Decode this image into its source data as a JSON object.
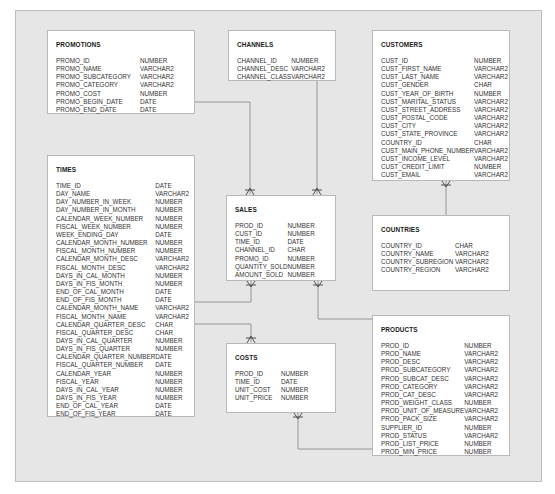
{
  "diagram": {
    "type": "entity-relationship",
    "tables": {
      "promotions": {
        "name": "PROMOTIONS",
        "columns": [
          {
            "name": "PROMO_ID",
            "type": "NUMBER"
          },
          {
            "name": "PROMO_NAME",
            "type": "VARCHAR2"
          },
          {
            "name": "PROMO_SUBCATEGORY",
            "type": "VARCHAR2"
          },
          {
            "name": "PROMO_CATEGORY",
            "type": "VARCHAR2"
          },
          {
            "name": "PROMO_COST",
            "type": "NUMBER"
          },
          {
            "name": "PROMO_BEGIN_DATE",
            "type": "DATE"
          },
          {
            "name": "PROMO_END_DATE",
            "type": "DATE"
          }
        ]
      },
      "channels": {
        "name": "CHANNELS",
        "columns": [
          {
            "name": "CHANNEL_ID",
            "type": "NUMBER"
          },
          {
            "name": "CHANNEL_DESC",
            "type": "VARCHAR2"
          },
          {
            "name": "CHANNEL_CLASS",
            "type": "VARCHAR2"
          }
        ]
      },
      "customers": {
        "name": "CUSTOMERS",
        "columns": [
          {
            "name": "CUST_ID",
            "type": "NUMBER"
          },
          {
            "name": "CUST_FIRST_NAME",
            "type": "VARCHAR2"
          },
          {
            "name": "CUST_LAST_NAME",
            "type": "VARCHAR2"
          },
          {
            "name": "CUST_GENDER",
            "type": "CHAR"
          },
          {
            "name": "CUST_YEAR_OF_BIRTH",
            "type": "NUMBER"
          },
          {
            "name": "CUST_MARITAL_STATUS",
            "type": "VARCHAR2"
          },
          {
            "name": "CUST_STREET_ADDRESS",
            "type": "VARCHAR2"
          },
          {
            "name": "CUST_POSTAL_CODE",
            "type": "VARCHAR2"
          },
          {
            "name": "CUST_CITY",
            "type": "VARCHAR2"
          },
          {
            "name": "CUST_STATE_PROVINCE",
            "type": "VARCHAR2"
          },
          {
            "name": "COUNTRY_ID",
            "type": "CHAR"
          },
          {
            "name": "CUST_MAIN_PHONE_NUMBER",
            "type": "VARCHAR2"
          },
          {
            "name": "CUST_INCOME_LEVEL",
            "type": "VARCHAR2"
          },
          {
            "name": "CUST_CREDIT_LIMIT",
            "type": "NUMBER"
          },
          {
            "name": "CUST_EMAIL",
            "type": "VARCHAR2"
          }
        ]
      },
      "times": {
        "name": "TIMES",
        "columns": [
          {
            "name": "TIME_ID",
            "type": "DATE"
          },
          {
            "name": "DAY_NAME",
            "type": "VARCHAR2"
          },
          {
            "name": "DAY_NUMBER_IN_WEEK",
            "type": "NUMBER"
          },
          {
            "name": "DAY_NUMBER_IN_MONTH",
            "type": "NUMBER"
          },
          {
            "name": "CALENDAR_WEEK_NUMBER",
            "type": "NUMBER"
          },
          {
            "name": "FISCAL_WEEK_NUMBER",
            "type": "NUMBER"
          },
          {
            "name": "WEEK_ENDING_DAY",
            "type": "DATE"
          },
          {
            "name": "CALENDAR_MONTH_NUMBER",
            "type": "NUMBER"
          },
          {
            "name": "FISCAL_MONTH_NUMBER",
            "type": "NUMBER"
          },
          {
            "name": "CALENDAR_MONTH_DESC",
            "type": "VARCHAR2"
          },
          {
            "name": "FISCAL_MONTH_DESC",
            "type": "VARCHAR2"
          },
          {
            "name": "DAYS_IN_CAL_MONTH",
            "type": "NUMBER"
          },
          {
            "name": "DAYS_IN_FIS_MONTH",
            "type": "NUMBER"
          },
          {
            "name": "END_OF_CAL_MONTH",
            "type": "DATE"
          },
          {
            "name": "END_OF_FIS_MONTH",
            "type": "DATE"
          },
          {
            "name": "CALENDAR_MONTH_NAME",
            "type": "VARCHAR2"
          },
          {
            "name": "FISCAL_MONTH_NAME",
            "type": "VARCHAR2"
          },
          {
            "name": "CALENDAR_QUARTER_DESC",
            "type": "CHAR"
          },
          {
            "name": "FISCAL_QUARTER_DESC",
            "type": "CHAR"
          },
          {
            "name": "DAYS_IN_CAL_QUARTER",
            "type": "NUMBER"
          },
          {
            "name": "DAYS_IN_FIS_QUARTER",
            "type": "NUMBER"
          },
          {
            "name": "CALENDAR_QUARTER_NUMBER",
            "type": "DATE"
          },
          {
            "name": "FISCAL_QUARTER_NUMBER",
            "type": "DATE"
          },
          {
            "name": "CALENDAR_YEAR",
            "type": "NUMBER"
          },
          {
            "name": "FISCAL_YEAR",
            "type": "NUMBER"
          },
          {
            "name": "DAYS_IN_CAL_YEAR",
            "type": "NUMBER"
          },
          {
            "name": "DAYS_IN_FIS_YEAR",
            "type": "NUMBER"
          },
          {
            "name": "END_OF_CAL_YEAR",
            "type": "DATE"
          },
          {
            "name": "END_OF_FIS_YEAR",
            "type": "DATE"
          }
        ]
      },
      "sales": {
        "name": "SALES",
        "columns": [
          {
            "name": "PROD_ID",
            "type": "NUMBER"
          },
          {
            "name": "CUST_ID",
            "type": "NUMBER"
          },
          {
            "name": "TIME_ID",
            "type": "DATE"
          },
          {
            "name": "CHANNEL_ID",
            "type": "CHAR"
          },
          {
            "name": "PROMO_ID",
            "type": "NUMBER"
          },
          {
            "name": "QUANTITY_SOLD",
            "type": "NUMBER"
          },
          {
            "name": "AMOUNT_SOLD",
            "type": "NUMBER"
          }
        ]
      },
      "countries": {
        "name": "COUNTRIES",
        "columns": [
          {
            "name": "COUNTRY_ID",
            "type": "CHAR"
          },
          {
            "name": "COUNTRY_NAME",
            "type": "VARCHAR2"
          },
          {
            "name": "COUNTRY_SUBREGION",
            "type": "VARCHAR2"
          },
          {
            "name": "COUNTRY_REGION",
            "type": "VARCHAR2"
          }
        ]
      },
      "products": {
        "name": "PRODUCTS",
        "columns": [
          {
            "name": "PROD_ID",
            "type": "NUMBER"
          },
          {
            "name": "PROD_NAME",
            "type": "VARCHAR2"
          },
          {
            "name": "PROD_DESC",
            "type": "VARCHAR2"
          },
          {
            "name": "PROD_SUBCATEGORY",
            "type": "VARCHAR2"
          },
          {
            "name": "PROD_SUBCAT_DESC",
            "type": "VARCHAR2"
          },
          {
            "name": "PROD_CATEGORY",
            "type": "VARCHAR2"
          },
          {
            "name": "PROD_CAT_DESC",
            "type": "VARCHAR2"
          },
          {
            "name": "PROD_WEIGHT_CLASS",
            "type": "NUMBER"
          },
          {
            "name": "PROD_UNIT_OF_MEASURE",
            "type": "VARCHAR2"
          },
          {
            "name": "PROD_PACK_SIZE",
            "type": "VARCHAR2"
          },
          {
            "name": "SUPPLIER_ID",
            "type": "NUMBER"
          },
          {
            "name": "PROD_STATUS",
            "type": "VARCHAR2"
          },
          {
            "name": "PROD_LIST_PRICE",
            "type": "NUMBER"
          },
          {
            "name": "PROD_MIN_PRICE",
            "type": "NUMBER"
          }
        ]
      },
      "costs": {
        "name": "COSTS",
        "columns": [
          {
            "name": "PROD_ID",
            "type": "NUMBER"
          },
          {
            "name": "TIME_ID",
            "type": "DATE"
          },
          {
            "name": "UNIT_COST",
            "type": "NUMBER"
          },
          {
            "name": "UNIT_PRICE",
            "type": "NUMBER"
          }
        ]
      }
    },
    "relationships": [
      {
        "from": "PROMOTIONS",
        "to": "SALES",
        "cardinality": "one-to-many"
      },
      {
        "from": "CHANNELS",
        "to": "SALES",
        "cardinality": "one-to-many"
      },
      {
        "from": "TIMES",
        "to": "SALES",
        "cardinality": "one-to-many"
      },
      {
        "from": "CUSTOMERS",
        "to": "SALES",
        "cardinality": "one-to-many"
      },
      {
        "from": "PRODUCTS",
        "to": "SALES",
        "cardinality": "one-to-many"
      },
      {
        "from": "COUNTRIES",
        "to": "CUSTOMERS",
        "cardinality": "one-to-many"
      },
      {
        "from": "TIMES",
        "to": "COSTS",
        "cardinality": "one-to-many"
      },
      {
        "from": "PRODUCTS",
        "to": "COSTS",
        "cardinality": "one-to-many"
      }
    ],
    "colors": {
      "panel": "#e6e6e6",
      "table_bg": "#ffffff",
      "border": "#b9b9b9",
      "line": "#8c8c8c",
      "text": "#333333"
    }
  }
}
